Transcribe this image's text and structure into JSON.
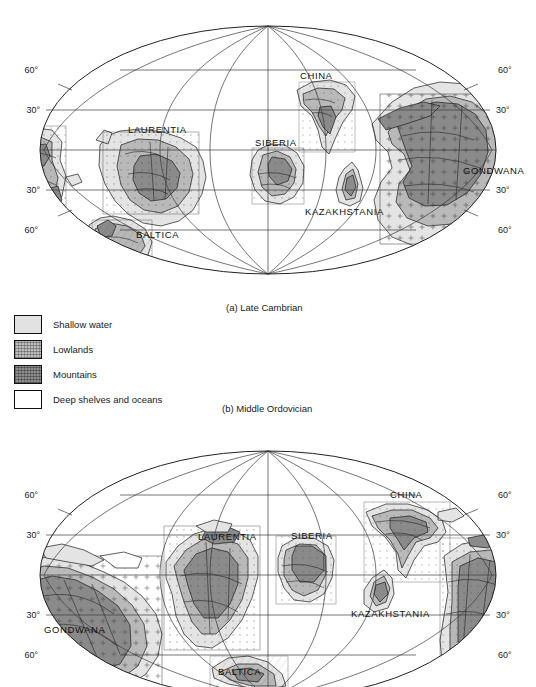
{
  "figure": {
    "type": "paleogeographic-map-pair",
    "projection": "Mollweide",
    "background_color": "#ffffff"
  },
  "legend": {
    "items": [
      {
        "label": "Shallow water",
        "swatch": "shallow-water-swatch",
        "color": "#e2e2e2"
      },
      {
        "label": "Lowlands",
        "swatch": "lowlands-swatch",
        "color": "#bdbdbd"
      },
      {
        "label": "Mountains",
        "swatch": "mountains-swatch",
        "color": "#8f8f8f"
      },
      {
        "label": "Deep shelves and oceans",
        "swatch": "deep-ocean-swatch",
        "color": "#ffffff"
      }
    ]
  },
  "captions": {
    "a": "(a) Late Cambrian",
    "b": "(b) Middle Ordovician"
  },
  "maps": [
    {
      "id": "late-cambrian",
      "caption": "(a) Late Cambrian",
      "latitude_labels": [
        "60°",
        "30°",
        "30°",
        "60°"
      ],
      "continents": [
        {
          "name": "LAURENTIA",
          "x": 128,
          "y": 119
        },
        {
          "name": "BALTICA",
          "x": 136,
          "y": 224
        },
        {
          "name": "SIBERIA",
          "x": 255,
          "y": 132
        },
        {
          "name": "CHINA",
          "x": 300,
          "y": 65
        },
        {
          "name": "KAZAKHSTANIA",
          "x": 305,
          "y": 201
        },
        {
          "name": "GONDWANA",
          "x": 463,
          "y": 160
        }
      ]
    },
    {
      "id": "middle-ordovician",
      "caption": "(b) Middle Ordovician",
      "latitude_labels": [
        "60°",
        "30°",
        "30°",
        "60°"
      ],
      "continents": [
        {
          "name": "LAURENTIA",
          "x": 198,
          "y": 110
        },
        {
          "name": "BALTICA",
          "x": 218,
          "y": 245
        },
        {
          "name": "SIBERIA",
          "x": 291,
          "y": 109
        },
        {
          "name": "CHINA",
          "x": 390,
          "y": 68
        },
        {
          "name": "KAZAKHSTANIA",
          "x": 351,
          "y": 187
        },
        {
          "name": "GONDWANA",
          "x": 78,
          "y": 203
        }
      ]
    }
  ]
}
